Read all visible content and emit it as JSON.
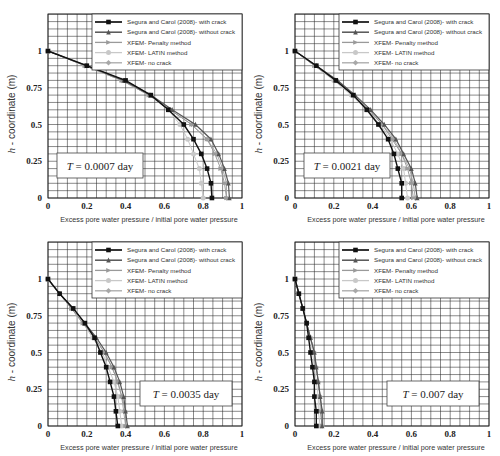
{
  "figure": {
    "xlabel": "Excess pore water pressure / initial pore water pressure",
    "ylabel_italic": "h",
    "ylabel_rest": " - coordinate (m)",
    "legend": [
      "Segura and Carol (2008)- with crack",
      "Segura and Carol (2008)- without crack",
      "XFEM- Penalty method",
      "XFEM- LATIN method",
      "XFEM- no crack"
    ],
    "xticks": [
      "0",
      "0.2",
      "0.4",
      "0.6",
      "0.8",
      "1"
    ],
    "yticks": [
      "0",
      "0.25",
      "0.5",
      "0.75",
      "1"
    ]
  },
  "chart_data": [
    {
      "type": "line",
      "title": "T = 0.0007 day",
      "xlabel": "Excess pore water pressure / initial pore water pressure",
      "ylabel": "h - coordinate (m)",
      "xlim": [
        0,
        1
      ],
      "ylim": [
        0,
        1.25
      ],
      "grid": true,
      "legend_position": "upper right",
      "annotation": {
        "text": "T = 0.0007 day",
        "position": "lower left"
      },
      "y": [
        1,
        0.9,
        0.8,
        0.7,
        0.6,
        0.5,
        0.4,
        0.3,
        0.2,
        0.1,
        0
      ],
      "series": [
        {
          "name": "Segura and Carol (2008)- with crack",
          "x": [
            0,
            0.2,
            0.4,
            0.53,
            0.62,
            0.7,
            0.75,
            0.79,
            0.82,
            0.84,
            0.845
          ]
        },
        {
          "name": "Segura and Carol (2008)- without crack",
          "x": [
            0,
            0.2,
            0.39,
            0.53,
            0.64,
            0.76,
            0.84,
            0.88,
            0.91,
            0.93,
            0.935
          ]
        },
        {
          "name": "XFEM- Penalty method",
          "x": [
            0,
            0.19,
            0.38,
            0.52,
            0.63,
            0.74,
            0.82,
            0.86,
            0.89,
            0.91,
            0.92
          ]
        },
        {
          "name": "XFEM- LATIN method",
          "x": [
            0,
            0.19,
            0.38,
            0.52,
            0.62,
            0.68,
            0.72,
            0.75,
            0.78,
            0.79,
            0.8
          ]
        },
        {
          "name": "XFEM- no crack",
          "x": [
            0,
            0.19,
            0.38,
            0.52,
            0.63,
            0.74,
            0.82,
            0.87,
            0.9,
            0.92,
            0.92
          ]
        }
      ]
    },
    {
      "type": "line",
      "title": "T = 0.0021 day",
      "xlabel": "Excess pore water pressure / initial pore water pressure",
      "ylabel": "h - coordinate (m)",
      "xlim": [
        0,
        1
      ],
      "ylim": [
        0,
        1.25
      ],
      "grid": true,
      "legend_position": "upper right",
      "annotation": {
        "text": "T = 0.0021 day",
        "position": "lower left"
      },
      "y": [
        1,
        0.9,
        0.8,
        0.7,
        0.6,
        0.5,
        0.4,
        0.3,
        0.2,
        0.1,
        0
      ],
      "series": [
        {
          "name": "Segura and Carol (2008)- with crack",
          "x": [
            0,
            0.11,
            0.21,
            0.3,
            0.37,
            0.43,
            0.48,
            0.51,
            0.53,
            0.55,
            0.55
          ]
        },
        {
          "name": "Segura and Carol (2008)- without crack",
          "x": [
            0,
            0.11,
            0.22,
            0.31,
            0.39,
            0.46,
            0.52,
            0.56,
            0.6,
            0.62,
            0.63
          ]
        },
        {
          "name": "XFEM- Penalty method",
          "x": [
            0,
            0.1,
            0.21,
            0.3,
            0.38,
            0.45,
            0.5,
            0.55,
            0.58,
            0.6,
            0.61
          ]
        },
        {
          "name": "XFEM- LATIN method",
          "x": [
            0,
            0.1,
            0.2,
            0.29,
            0.37,
            0.44,
            0.49,
            0.53,
            0.56,
            0.57,
            0.58
          ]
        },
        {
          "name": "XFEM- no crack",
          "x": [
            0,
            0.1,
            0.21,
            0.3,
            0.38,
            0.45,
            0.51,
            0.55,
            0.59,
            0.61,
            0.62
          ]
        }
      ]
    },
    {
      "type": "line",
      "title": "T = 0.0035 day",
      "xlabel": "Excess pore water pressure / initial pore water pressure",
      "ylabel": "h - coordinate (m)",
      "xlim": [
        0,
        1
      ],
      "ylim": [
        0,
        1.25
      ],
      "grid": true,
      "legend_position": "upper right",
      "annotation": {
        "text": "T = 0.0035 day",
        "position": "lower right"
      },
      "y": [
        1,
        0.9,
        0.8,
        0.7,
        0.6,
        0.5,
        0.4,
        0.3,
        0.2,
        0.1,
        0
      ],
      "series": [
        {
          "name": "Segura and Carol (2008)- with crack",
          "x": [
            0,
            0.06,
            0.13,
            0.19,
            0.24,
            0.27,
            0.3,
            0.32,
            0.34,
            0.35,
            0.36
          ]
        },
        {
          "name": "Segura and Carol (2008)- without crack",
          "x": [
            0,
            0.06,
            0.13,
            0.19,
            0.25,
            0.3,
            0.34,
            0.37,
            0.39,
            0.4,
            0.41
          ]
        },
        {
          "name": "XFEM- Penalty method",
          "x": [
            0,
            0.06,
            0.12,
            0.18,
            0.24,
            0.29,
            0.33,
            0.36,
            0.38,
            0.4,
            0.4
          ]
        },
        {
          "name": "XFEM- LATIN method",
          "x": [
            0,
            0.06,
            0.12,
            0.18,
            0.23,
            0.28,
            0.31,
            0.34,
            0.36,
            0.37,
            0.38
          ]
        },
        {
          "name": "XFEM- no crack",
          "x": [
            0,
            0.06,
            0.12,
            0.18,
            0.24,
            0.29,
            0.33,
            0.36,
            0.38,
            0.39,
            0.4
          ]
        }
      ]
    },
    {
      "type": "line",
      "title": "T = 0.007 day",
      "xlabel": "Excess pore water pressure / initial pore water pressure",
      "ylabel": "h - coordinate (m)",
      "xlim": [
        0,
        1
      ],
      "ylim": [
        0,
        1.25
      ],
      "grid": true,
      "legend_position": "upper right",
      "annotation": {
        "text": "T = 0.007 day",
        "position": "lower right"
      },
      "y": [
        1,
        0.9,
        0.8,
        0.7,
        0.6,
        0.5,
        0.4,
        0.3,
        0.2,
        0.1,
        0
      ],
      "series": [
        {
          "name": "Segura and Carol (2008)- with crack",
          "x": [
            0,
            0.02,
            0.04,
            0.06,
            0.07,
            0.08,
            0.09,
            0.1,
            0.1,
            0.11,
            0.11
          ]
        },
        {
          "name": "Segura and Carol (2008)- without crack",
          "x": [
            0,
            0.02,
            0.04,
            0.06,
            0.08,
            0.1,
            0.11,
            0.12,
            0.13,
            0.14,
            0.14
          ]
        },
        {
          "name": "XFEM- Penalty method",
          "x": [
            0,
            0.02,
            0.04,
            0.06,
            0.08,
            0.1,
            0.11,
            0.12,
            0.13,
            0.13,
            0.14
          ]
        },
        {
          "name": "XFEM- LATIN method",
          "x": [
            0,
            0.02,
            0.04,
            0.06,
            0.08,
            0.09,
            0.1,
            0.11,
            0.12,
            0.12,
            0.13
          ]
        },
        {
          "name": "XFEM- no crack",
          "x": [
            0,
            0.02,
            0.04,
            0.06,
            0.08,
            0.1,
            0.11,
            0.12,
            0.13,
            0.14,
            0.14
          ]
        }
      ]
    }
  ],
  "styles": {
    "series_colors": [
      "#111111",
      "#555555",
      "#9a9a9a",
      "#c8c8c8",
      "#a8a8a8"
    ],
    "series_markers": [
      "square",
      "triangle",
      "arrow",
      "circle",
      "diamond"
    ],
    "series_widths": [
      1.4,
      1.2,
      1.0,
      1.0,
      1.0
    ]
  }
}
